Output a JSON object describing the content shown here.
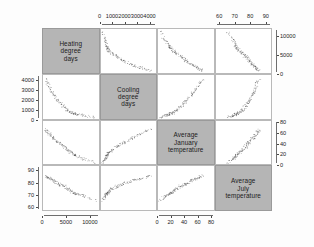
{
  "figure": {
    "kind": "scatterplot-matrix",
    "background_color": "#fdfdfd",
    "panel_background_color": "#ffffff",
    "diagonal_panel_color": "#b5b5b5",
    "point_color": "#3a3a3a",
    "grid_line_color": "#b9b9b9"
  },
  "variables": [
    {
      "key": "hdd",
      "label_lines": [
        "Heating",
        "degree",
        "days"
      ],
      "axis_min": 0,
      "axis_max": 12000,
      "ticks": [
        0,
        5000,
        10000
      ],
      "tick_labels": [
        "0",
        "5000",
        "10000"
      ],
      "x_axis_side": "bottom",
      "y_axis_side": "right",
      "right_ticks": [
        0,
        5000,
        10000
      ],
      "right_tick_labels": [
        "0",
        "5000",
        "10000"
      ]
    },
    {
      "key": "cdd",
      "label_lines": [
        "Cooling",
        "degree",
        "days"
      ],
      "axis_min": 0,
      "axis_max": 4600,
      "ticks": [
        0,
        1000,
        2000,
        3000,
        4000
      ],
      "tick_labels": [
        "0",
        "1000",
        "2000",
        "3000",
        "4000"
      ],
      "x_axis_side": "top",
      "y_axis_side": "left",
      "left_ticks": [
        0,
        1000,
        2000,
        3000,
        4000
      ],
      "left_tick_labels": [
        "0",
        "1000",
        "2000",
        "3000",
        "4000"
      ]
    },
    {
      "key": "jan_temp",
      "label_lines": [
        "Average",
        "January",
        "temperature"
      ],
      "axis_min": 0,
      "axis_max": 85,
      "ticks": [
        0,
        20,
        40,
        60,
        80
      ],
      "tick_labels": [
        "0",
        "20",
        "40",
        "60",
        "80"
      ],
      "x_axis_side": "bottom",
      "y_axis_side": "right",
      "right_ticks": [
        0,
        20,
        40,
        60,
        80
      ],
      "right_tick_labels": [
        "0",
        "20",
        "40",
        "60",
        "80"
      ]
    },
    {
      "key": "jul_temp",
      "label_lines": [
        "Average",
        "July",
        "temperature"
      ],
      "axis_min": 57,
      "axis_max": 94,
      "ticks": [
        60,
        70,
        80,
        90
      ],
      "tick_labels": [
        "60",
        "70",
        "80",
        "90"
      ],
      "x_axis_side": "top",
      "y_axis_side": "left",
      "left_ticks": [
        60,
        70,
        80,
        90
      ],
      "left_tick_labels": [
        "60",
        "70",
        "80",
        "90"
      ]
    }
  ],
  "chart_data": {
    "type": "scatter",
    "title": "",
    "subtitle": "",
    "xlabel": "",
    "ylabel": "",
    "grid": false,
    "legend": "none",
    "matrix_layout": "4x4 scatterplot matrix, diagonal holds variable name panels",
    "axis_placement": {
      "top": "Cooling degree days (col 2), Average July temperature (col 4)",
      "bottom": "Heating degree days (col 1), Average January temperature (col 3)",
      "left": "Cooling degree days (row 2), Average July temperature (row 4)",
      "right": "Heating degree days (row 1), Average January temperature (row 3)"
    },
    "variables": [
      "Heating degree days",
      "Cooling degree days",
      "Average January temperature",
      "Average July temperature"
    ],
    "axis_ranges": {
      "Heating degree days": [
        0,
        12000
      ],
      "Cooling degree days": [
        0,
        4600
      ],
      "Average January temperature": [
        0,
        85
      ],
      "Average July temperature": [
        57,
        94
      ]
    },
    "n_points": 120,
    "relationships": [
      {
        "x": "Cooling degree days",
        "y": "Heating degree days",
        "form": "negative curved (convex decreasing)"
      },
      {
        "x": "Average January temperature",
        "y": "Heating degree days",
        "form": "strong negative near-linear"
      },
      {
        "x": "Average July temperature",
        "y": "Heating degree days",
        "form": "negative, fanned / diffuse"
      },
      {
        "x": "Heating degree days",
        "y": "Cooling degree days",
        "form": "negative curved (convex decreasing)"
      },
      {
        "x": "Average January temperature",
        "y": "Cooling degree days",
        "form": "positive curved (convex increasing)"
      },
      {
        "x": "Average July temperature",
        "y": "Cooling degree days",
        "form": "positive curved (convex increasing)"
      },
      {
        "x": "Heating degree days",
        "y": "Average January temperature",
        "form": "strong negative near-linear"
      },
      {
        "x": "Cooling degree days",
        "y": "Average January temperature",
        "form": "positive curved"
      },
      {
        "x": "Average July temperature",
        "y": "Average January temperature",
        "form": "positive, moderate scatter"
      },
      {
        "x": "Heating degree days",
        "y": "Average July temperature",
        "form": "negative, diffuse"
      },
      {
        "x": "Cooling degree days",
        "y": "Average July temperature",
        "form": "positive concave (log-like)"
      },
      {
        "x": "Average January temperature",
        "y": "Average July temperature",
        "form": "positive, diffuse cloud"
      }
    ],
    "series": [
      {
        "name": "US weather stations",
        "points_hdd_cdd_jan_jul": [
          [
            6200,
            620,
            22,
            72
          ],
          [
            7100,
            480,
            18,
            70
          ],
          [
            5400,
            900,
            28,
            75
          ],
          [
            4100,
            1500,
            38,
            78
          ],
          [
            2200,
            2600,
            52,
            82
          ],
          [
            1400,
            3300,
            60,
            84
          ],
          [
            800,
            3900,
            66,
            85
          ],
          [
            9200,
            300,
            10,
            68
          ],
          [
            8300,
            380,
            13,
            69
          ],
          [
            6800,
            540,
            20,
            71
          ],
          [
            5900,
            700,
            25,
            73
          ],
          [
            3500,
            1800,
            42,
            79
          ],
          [
            2800,
            2200,
            47,
            80
          ],
          [
            1800,
            2900,
            56,
            83
          ],
          [
            10500,
            200,
            6,
            66
          ],
          [
            7600,
            430,
            16,
            70
          ],
          [
            6400,
            600,
            23,
            72
          ],
          [
            4800,
            1200,
            33,
            77
          ],
          [
            3900,
            1600,
            40,
            78
          ],
          [
            2500,
            2400,
            50,
            81
          ],
          [
            1200,
            3500,
            62,
            84
          ],
          [
            11200,
            150,
            3,
            65
          ],
          [
            8900,
            330,
            11,
            68
          ],
          [
            7300,
            470,
            17,
            70
          ],
          [
            6000,
            660,
            24,
            73
          ],
          [
            5100,
            980,
            30,
            75
          ],
          [
            4400,
            1350,
            36,
            77
          ],
          [
            3200,
            1950,
            44,
            79
          ],
          [
            2000,
            2750,
            54,
            82
          ],
          [
            900,
            3800,
            65,
            85
          ],
          [
            6600,
            560,
            21,
            71
          ],
          [
            5700,
            760,
            26,
            74
          ],
          [
            4600,
            1280,
            34,
            76
          ],
          [
            3700,
            1700,
            41,
            78
          ],
          [
            2400,
            2500,
            51,
            81
          ],
          [
            1600,
            3100,
            58,
            83
          ],
          [
            600,
            4100,
            68,
            86
          ],
          [
            9800,
            250,
            8,
            67
          ],
          [
            8600,
            350,
            12,
            69
          ],
          [
            7800,
            410,
            15,
            70
          ],
          [
            6900,
            520,
            19,
            71
          ],
          [
            5500,
            870,
            27,
            74
          ],
          [
            4300,
            1420,
            37,
            77
          ],
          [
            3000,
            2050,
            45,
            80
          ],
          [
            2100,
            2700,
            53,
            82
          ],
          [
            1000,
            3700,
            64,
            84
          ],
          [
            7000,
            500,
            18,
            71
          ],
          [
            5200,
            950,
            29,
            75
          ],
          [
            3300,
            1880,
            43,
            79
          ],
          [
            1500,
            3200,
            59,
            83
          ]
        ]
      }
    ]
  }
}
